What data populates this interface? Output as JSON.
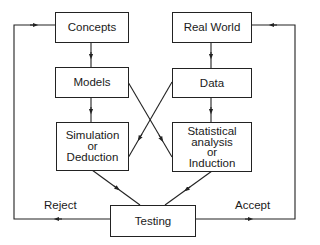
{
  "diagram": {
    "nodes": {
      "concepts": "Concepts",
      "real_world": "Real World",
      "models": "Models",
      "data": "Data",
      "simulation": [
        "Simulation",
        "or",
        "Deduction"
      ],
      "statistical": [
        "Statistical",
        "analysis",
        "or",
        "Induction"
      ],
      "testing": "Testing"
    },
    "edge_labels": {
      "reject": "Reject",
      "accept": "Accept"
    },
    "edges": [
      {
        "from": "concepts",
        "to": "models"
      },
      {
        "from": "models",
        "to": "simulation"
      },
      {
        "from": "models",
        "to": "statistical"
      },
      {
        "from": "real_world",
        "to": "data"
      },
      {
        "from": "data",
        "to": "statistical"
      },
      {
        "from": "data",
        "to": "simulation"
      },
      {
        "from": "simulation",
        "to": "testing"
      },
      {
        "from": "statistical",
        "to": "testing"
      },
      {
        "from": "testing",
        "to": "concepts",
        "label": "Reject"
      },
      {
        "from": "testing",
        "to": "real_world",
        "label": "Accept"
      }
    ],
    "colors": {
      "line": "#222222",
      "background": "#ffffff"
    }
  }
}
